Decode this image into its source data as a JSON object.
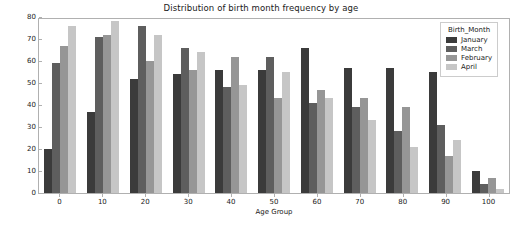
{
  "chart_data": {
    "type": "bar",
    "title": "Distribution of birth month frequency by age",
    "xlabel": "Age Group",
    "ylabel": "count",
    "categories": [
      "0",
      "10",
      "20",
      "30",
      "40",
      "50",
      "60",
      "70",
      "80",
      "90",
      "100"
    ],
    "ylim": [
      0,
      80
    ],
    "yticks": [
      "0",
      "10",
      "20",
      "30",
      "40",
      "50",
      "60",
      "70",
      "80"
    ],
    "grid": false,
    "legend_title": "Birth_Month",
    "legend_position": "upper right",
    "series": [
      {
        "name": "January",
        "color": "#3b3b3b",
        "values": [
          20,
          37,
          52,
          54,
          56,
          56,
          66,
          57,
          57,
          55,
          10
        ]
      },
      {
        "name": "March",
        "color": "#5e5e5e",
        "values": [
          59,
          71,
          76,
          66,
          48,
          62,
          41,
          39,
          28,
          31,
          4
        ]
      },
      {
        "name": "February",
        "color": "#969696",
        "values": [
          67,
          72,
          60,
          56,
          62,
          43,
          47,
          43,
          39,
          17,
          7
        ]
      },
      {
        "name": "April",
        "color": "#c6c6c6",
        "values": [
          76,
          78,
          72,
          64,
          49,
          55,
          43,
          33,
          21,
          24,
          2
        ]
      }
    ]
  }
}
